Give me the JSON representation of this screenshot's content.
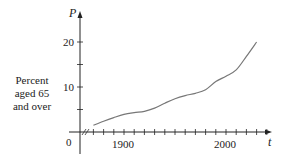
{
  "chart_data": {
    "type": "line",
    "title": "",
    "xlabel": "t",
    "ylabel": "Percent aged 65 and over",
    "y_axis_symbol": "P",
    "x_ticks_labeled": [
      {
        "value": 1900,
        "label": "1900"
      },
      {
        "value": 2000,
        "label": "2000"
      }
    ],
    "x_tick_interval": 10,
    "x_tick_range": [
      1870,
      2040
    ],
    "y_ticks_labeled": [
      {
        "value": 0,
        "label": "0"
      },
      {
        "value": 10,
        "label": "10"
      },
      {
        "value": 20,
        "label": "20"
      }
    ],
    "y_tick_interval": 5,
    "xlim": [
      1860,
      2045
    ],
    "ylim": [
      0,
      22
    ],
    "axis_break": true,
    "grid": false,
    "legend": null,
    "series": [
      {
        "name": "Percent aged 65 and over",
        "x": [
          1870,
          1880,
          1890,
          1900,
          1910,
          1920,
          1930,
          1940,
          1950,
          1960,
          1970,
          1980,
          1990,
          2000,
          2010,
          2020,
          2030
        ],
        "values": [
          1.5,
          2.4,
          3.2,
          3.9,
          4.3,
          4.6,
          5.3,
          6.4,
          7.4,
          8.1,
          8.6,
          9.4,
          11.2,
          12.4,
          13.8,
          16.8,
          20.0
        ]
      }
    ],
    "colors": {
      "axis": "#222222",
      "curve": "#777777"
    }
  },
  "labels": {
    "ylabel_line1": "Percent",
    "ylabel_line2": "aged 65",
    "ylabel_line3": "and over",
    "y_symbol": "P",
    "x_symbol": "t",
    "origin": "0",
    "y10": "10",
    "y20": "20",
    "x1900": "1900",
    "x2000": "2000"
  }
}
